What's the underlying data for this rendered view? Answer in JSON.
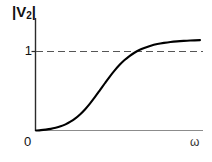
{
  "figure": {
    "background_color": "#ffffff",
    "axis_color": "#2b2b2b",
    "xaxis_color": "#8c8c8c",
    "curve_color": "#000000",
    "dash_color": "#555555"
  },
  "labels": {
    "ylabel_open_bar": "|",
    "ylabel_symbol": "V",
    "ylabel_subscript": "2",
    "ylabel_close_bar": "|",
    "ytick_one": "1",
    "origin": "0",
    "xlabel": "ω"
  },
  "chart_data": {
    "type": "line",
    "title": "",
    "xlabel": "ω",
    "ylabel": "|V2|",
    "xlim": [
      0,
      1
    ],
    "ylim": [
      0,
      1.12
    ],
    "grid": false,
    "legend": null,
    "xticks": [
      0
    ],
    "xticklabels": [
      "0"
    ],
    "yticks": [
      0,
      1
    ],
    "yticklabels": [
      "0",
      "1"
    ],
    "annotations": [
      {
        "type": "hline",
        "y": 1,
        "style": "dashed",
        "label": "1",
        "description": "asymptote at |V2| = 1"
      }
    ],
    "series": [
      {
        "name": "|V2|",
        "style": "solid",
        "x": [
          0.0,
          0.03,
          0.06,
          0.09,
          0.12,
          0.15,
          0.18,
          0.21,
          0.24,
          0.27,
          0.3,
          0.33,
          0.36,
          0.39,
          0.42,
          0.45,
          0.48,
          0.51,
          0.54,
          0.57,
          0.6,
          0.63,
          0.66,
          0.7,
          0.74,
          0.78,
          0.82,
          0.86,
          0.9,
          0.94,
          1.0
        ],
        "y": [
          0.0,
          0.004,
          0.01,
          0.018,
          0.03,
          0.046,
          0.068,
          0.097,
          0.134,
          0.18,
          0.235,
          0.299,
          0.37,
          0.445,
          0.521,
          0.595,
          0.663,
          0.724,
          0.777,
          0.821,
          0.857,
          0.887,
          0.91,
          0.935,
          0.953,
          0.966,
          0.976,
          0.983,
          0.988,
          0.992,
          0.996
        ]
      }
    ]
  }
}
